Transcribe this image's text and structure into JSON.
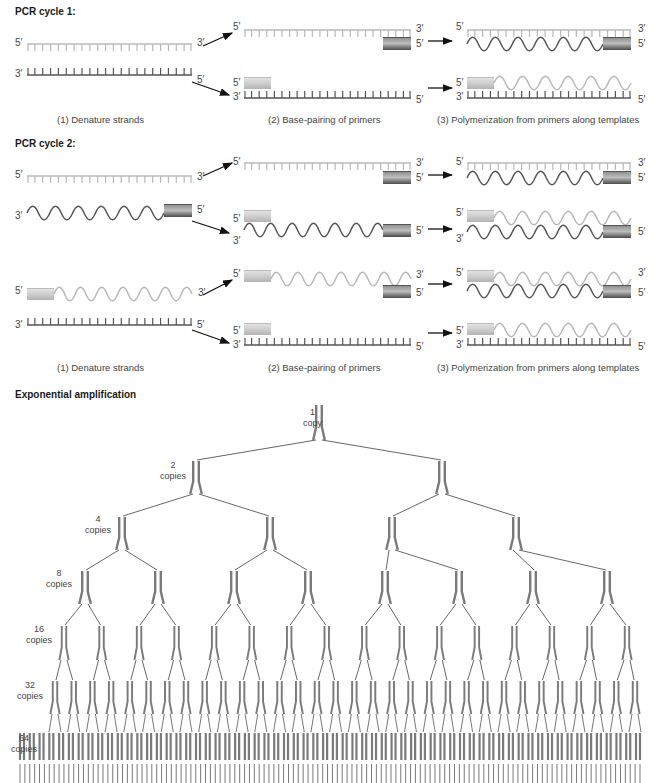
{
  "cycle1": {
    "title": "PCR cycle 1:",
    "captions": [
      "(1) Denature strands",
      "(2) Base-pairing of primers",
      "(3) Polymerization from primers along templates"
    ]
  },
  "cycle2": {
    "title": "PCR cycle 2:",
    "captions": [
      "(1) Denature strands",
      "(2) Base-pairing of primers",
      "(3) Polymerization from primers along templates"
    ]
  },
  "end_labels": {
    "five_prime": "5′",
    "three_prime": "3′"
  },
  "amplification": {
    "title": "Exponential amplification",
    "levels": [
      {
        "count": "1",
        "unit": "copy"
      },
      {
        "count": "2",
        "unit": "copies"
      },
      {
        "count": "4",
        "unit": "copies"
      },
      {
        "count": "8",
        "unit": "copies"
      },
      {
        "count": "16",
        "unit": "copies"
      },
      {
        "count": "32",
        "unit": "copies"
      },
      {
        "count": "64",
        "unit": "copies"
      }
    ]
  },
  "colors": {
    "light_strand": "#b8b8b8",
    "dark_strand": "#555555",
    "primer_light": "#c8c8c8",
    "primer_dark": "#5a5a5a",
    "tree_dna": "#7a7a7a",
    "tree_line": "#555555",
    "arrow": "#111111"
  }
}
